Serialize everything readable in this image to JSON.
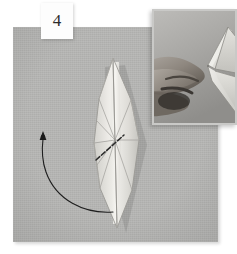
{
  "figure": {
    "kind": "origami-instruction-step",
    "step_number": "4",
    "background_color": "#b6b6b4",
    "page_color": "#ffffff"
  },
  "plate": {
    "name": "main-photo-plate",
    "x": 13,
    "y": 27,
    "width": 205,
    "height": 215
  },
  "inset": {
    "name": "hand-detail-photo",
    "x": 152,
    "y": 9,
    "width": 85,
    "height": 116,
    "subject": "hand holding folded paper model edge-on",
    "border_color": "#c9c9c7"
  },
  "model": {
    "name": "paper-model",
    "shape": "elongated-diamond-kite",
    "top_point": [
      113,
      58
    ],
    "bottom_point": [
      117,
      228
    ],
    "left_point": [
      94,
      143
    ],
    "right_point": [
      139,
      140
    ],
    "paper_light": "#efeeea",
    "paper_mid": "#dcdbd6",
    "paper_shadow": "#c4c3be",
    "crease_color": "#9a9a95",
    "crease_hub": [
      115,
      140
    ]
  },
  "annotations": {
    "fold_line": {
      "name": "valley-fold-dashed-line",
      "from": [
        96,
        160
      ],
      "to": [
        124,
        135
      ],
      "color": "#2a2a2a"
    },
    "arrow": {
      "name": "fold-direction-arrow",
      "description": "curved arrow sweeping from lower right of model up and around to the left",
      "tail": [
        113,
        212
      ],
      "head": [
        43,
        137
      ],
      "color": "#1e1e1e",
      "head_style": "filled-point"
    }
  },
  "colors": {
    "accent": "#2a2a2a",
    "plate": "#b6b6b4",
    "paper": "#efeeea"
  }
}
